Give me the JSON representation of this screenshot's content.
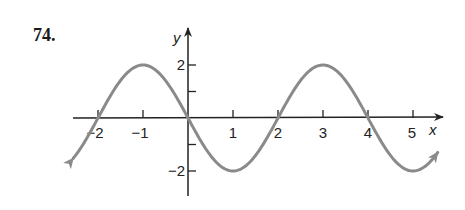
{
  "problem": {
    "number": "74."
  },
  "colors": {
    "curve": "#8a8a8a",
    "axis": "#222222"
  },
  "chart_data": {
    "type": "line",
    "title": "",
    "function": "y = -2 sin(pi x / 2)",
    "xlabel": "x",
    "ylabel": "y",
    "xlim": [
      -2.55,
      5.55
    ],
    "ylim": [
      -2.9,
      3.3
    ],
    "x_ticks": [
      -2,
      -1,
      0,
      1,
      2,
      3,
      4,
      5
    ],
    "x_tick_labels": [
      "−2",
      "−1",
      "1",
      "2",
      "3",
      "4",
      "5"
    ],
    "x_tick_label_values": [
      -2,
      -1,
      1,
      2,
      3,
      4,
      5
    ],
    "y_ticks": [
      -2,
      -1,
      1,
      2
    ],
    "y_tick_labels": [
      "2",
      "−2"
    ],
    "y_tick_label_values": [
      2,
      -2
    ],
    "grid": false,
    "legend": null,
    "arrows_on_curve_ends": true,
    "series": [
      {
        "name": "y = -2 sin(πx/2)",
        "x": [
          -2.5,
          -2,
          -1.5,
          -1,
          -0.5,
          0,
          0.5,
          1,
          1.5,
          2,
          2.5,
          3,
          3.5,
          4,
          4.5,
          5,
          5.5
        ],
        "values": [
          -1.41,
          0,
          1.41,
          2,
          1.41,
          0,
          -1.41,
          -2,
          -1.41,
          0,
          1.41,
          2,
          1.41,
          0,
          -1.41,
          -2,
          -1.41
        ]
      }
    ],
    "key_points": {
      "maxima": [
        [
          -1,
          2
        ],
        [
          3,
          2
        ]
      ],
      "minima": [
        [
          1,
          -2
        ],
        [
          5,
          -2
        ]
      ],
      "zeros": [
        -2,
        0,
        2,
        4
      ]
    }
  }
}
